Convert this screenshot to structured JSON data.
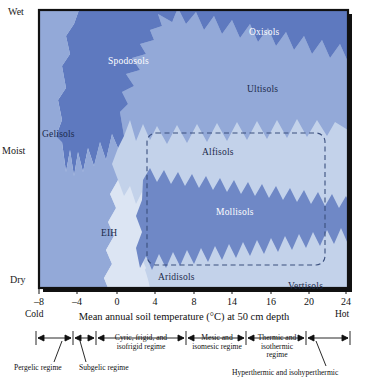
{
  "figure": {
    "plot": {
      "x0": 39,
      "y0": 10,
      "x1": 348,
      "y1": 288
    }
  },
  "y_axis": {
    "name": "soil-moisture",
    "labels": {
      "top": "Wet",
      "middle": "Moist",
      "bottom": "Dry"
    }
  },
  "x_axis": {
    "title": "Mean annual soil temperature (°C) at 50 cm depth",
    "ticks": [
      "–8",
      "–4",
      "0",
      "4",
      "8",
      "14",
      "16",
      "20",
      "24"
    ],
    "tick_positions": [
      39,
      77,
      117,
      155,
      194,
      232,
      271,
      309,
      346
    ],
    "cold_label": "Cold",
    "hot_label": "Hot"
  },
  "soil_orders": [
    {
      "name": "Gelisols",
      "label": "Gelisols",
      "x": 42,
      "y": 129,
      "tone": "dark"
    },
    {
      "name": "Spodosols",
      "label": "Spodosols",
      "x": 108,
      "y": 56,
      "tone": "light"
    },
    {
      "name": "Oxisols",
      "label": "Oxisols",
      "x": 249,
      "y": 27,
      "tone": "light"
    },
    {
      "name": "Ultisols",
      "label": "Ultisols",
      "x": 247,
      "y": 84,
      "tone": "dark"
    },
    {
      "name": "Alfisols",
      "label": "Alfisols",
      "x": 202,
      "y": 147,
      "tone": "dark"
    },
    {
      "name": "Mollisols",
      "label": "Mollisols",
      "x": 216,
      "y": 207,
      "tone": "light"
    },
    {
      "name": "EIH",
      "label": "EIH",
      "x": 101,
      "y": 228,
      "tone": "dark"
    },
    {
      "name": "Aridisols",
      "label": "Aridisols",
      "x": 158,
      "y": 272,
      "tone": "dark"
    },
    {
      "name": "Vertisols",
      "label": "Vertisols",
      "x": 288,
      "y": 281,
      "tone": "dark"
    }
  ],
  "temperature_regimes": [
    {
      "name": "pergelic",
      "label": "Pergelic regime",
      "text_x": 18,
      "text_y": 369,
      "bracket_x0": 36,
      "bracket_x1": 72,
      "pointer_from_x": 62,
      "pointer_to_x": 54
    },
    {
      "name": "subgelic",
      "label": "Subgelic regime",
      "text_x": 80,
      "text_y": 369,
      "bracket_x0": 73,
      "bracket_x1": 95,
      "pointer_from_x": 96,
      "pointer_to_x": 84
    },
    {
      "name": "cryic",
      "label": "Cyric, frigid, and\nisofrigid regime",
      "text_x": 100,
      "text_y": 342,
      "bracket_x0": 97,
      "bracket_x1": 185
    },
    {
      "name": "mesic",
      "label": "Mesic and\nisomesic regime",
      "text_x": 188,
      "text_y": 342,
      "bracket_x0": 187,
      "bracket_x1": 245
    },
    {
      "name": "thermic",
      "label": "Thermic and\nisothermic regime",
      "text_x": 248,
      "text_y": 342,
      "bracket_x0": 247,
      "bracket_x1": 305
    },
    {
      "name": "hyperthermic",
      "label": "Hyperthermic and isohyperthermic",
      "text_x": 234,
      "text_y": 372,
      "bracket_x0": 307,
      "bracket_x1": 350,
      "pointer_from_x": 316,
      "pointer_to_x": 326
    }
  ],
  "colors": {
    "deep_blue": "#5e79bf",
    "mid_blue": "#93a9d8",
    "light_blue": "#c3d2ea",
    "pale_blue": "#dce5f3",
    "outline": "#2b3f6b",
    "frame": "#111111",
    "dash": "#3a4f7d",
    "background": "#ffffff"
  },
  "dashed_box": {
    "name": "udic-moisture-box",
    "x": 147,
    "y": 133,
    "width": 178,
    "height": 132,
    "radius": 9
  }
}
